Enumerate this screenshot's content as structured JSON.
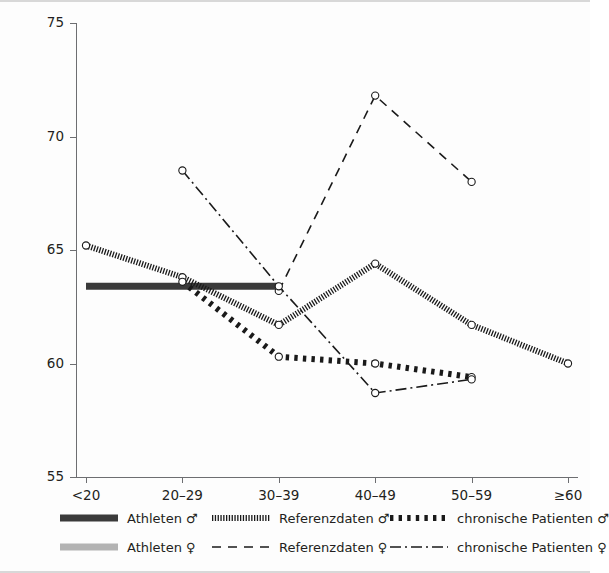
{
  "axes": {
    "y_title": "LWS-/BWS-Gesamtmobilität frontal (in Grad)",
    "y_ticks": [
      "75",
      "70",
      "65",
      "60",
      "55"
    ],
    "x_ticks": [
      "<20",
      "20–29",
      "30–39",
      "40–49",
      "50–59",
      "≥60"
    ]
  },
  "legend": {
    "items": [
      {
        "label": "Athleten ♂",
        "style": "thick-solid-dark",
        "color": "#3a3a3a"
      },
      {
        "label": "Referenzdaten ♂",
        "style": "dense-hatch",
        "color": "#1a1a1a"
      },
      {
        "label": "chronische Patienten ♂",
        "style": "thick-dotted",
        "color": "#1a1a1a"
      },
      {
        "label": "Athleten ♀",
        "style": "thick-solid-gray",
        "color": "#b3b3b3"
      },
      {
        "label": "Referenzdaten ♀",
        "style": "dashed",
        "color": "#1a1a1a"
      },
      {
        "label": "chronische Patienten ♀",
        "style": "dash-dot",
        "color": "#1a1a1a"
      }
    ]
  },
  "chart_data": {
    "type": "line",
    "title": "",
    "xlabel": "",
    "ylabel": "LWS-/BWS-Gesamtmobilität frontal (in Grad)",
    "categories": [
      "<20",
      "20–29",
      "30–39",
      "40–49",
      "50–59",
      "≥60"
    ],
    "ylim": [
      55,
      75
    ],
    "yticks": [
      55,
      60,
      65,
      70,
      75
    ],
    "grid": false,
    "legend_position": "below-axes",
    "series": [
      {
        "name": "Athleten ♂",
        "style": "thick-solid-dark",
        "color": "#3a3a3a",
        "markers": false,
        "x": [
          "<20",
          "20–29",
          "30–39"
        ],
        "values": [
          63.4,
          63.4,
          63.4
        ]
      },
      {
        "name": "Athleten ♀",
        "style": "thick-solid-gray",
        "color": "#b3b3b3",
        "markers": false,
        "x": [],
        "values": []
      },
      {
        "name": "Referenzdaten ♂",
        "style": "dense-hatch",
        "color": "#1a1a1a",
        "markers": true,
        "x": [
          "<20",
          "20–29",
          "30–39",
          "40–49",
          "50–59",
          "≥60"
        ],
        "values": [
          65.2,
          63.8,
          61.7,
          64.4,
          61.7,
          60.0
        ]
      },
      {
        "name": "chronische Patienten ♂",
        "style": "thick-dotted",
        "color": "#1a1a1a",
        "markers": true,
        "x": [
          "20–29",
          "30–39",
          "40–49",
          "50–59"
        ],
        "values": [
          63.6,
          60.3,
          60.0,
          59.4
        ]
      },
      {
        "name": "Referenzdaten ♀",
        "style": "dashed",
        "color": "#1a1a1a",
        "markers": true,
        "x": [
          "30–39",
          "40–49",
          "50–59"
        ],
        "values": [
          63.2,
          71.8,
          68.0
        ]
      },
      {
        "name": "chronische Patienten ♀",
        "style": "dash-dot",
        "color": "#1a1a1a",
        "markers": true,
        "x": [
          "20–29",
          "30–39",
          "40–49",
          "50–59"
        ],
        "values": [
          68.5,
          63.4,
          58.7,
          59.3
        ]
      }
    ]
  }
}
